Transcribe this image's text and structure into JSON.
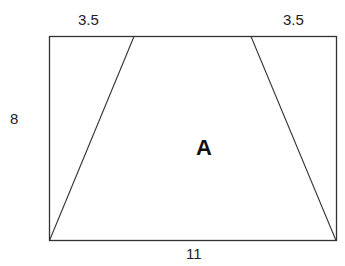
{
  "diagram": {
    "type": "trapezoid inscribed in rectangle",
    "labels": {
      "top_left_segment": "3.5",
      "top_right_segment": "3.5",
      "height": "8",
      "base": "11",
      "region": "A"
    },
    "rectangle": {
      "x1": 49,
      "y1": 36,
      "x2": 336,
      "y2": 240
    },
    "trapezoid": {
      "top_left_x": 134,
      "top_right_x": 251
    },
    "colors": {
      "stroke": "#333333",
      "background": "#ffffff"
    }
  }
}
